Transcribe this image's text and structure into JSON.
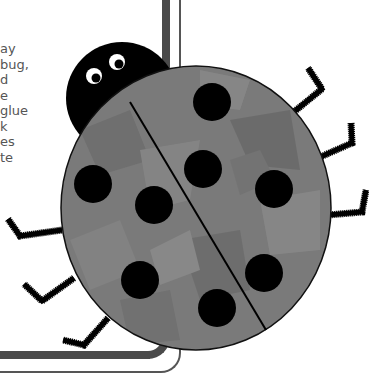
{
  "text_fragment": {
    "lines": [
      "ay",
      "bug,",
      "d",
      "e",
      "glue",
      "k",
      "es",
      "te"
    ]
  },
  "illustration": {
    "subject": "ladybug",
    "body_color": "#7a7a7a",
    "spot_color": "#000000",
    "head_color": "#000000",
    "spot_count": 8,
    "leg_count": 6
  },
  "icons": {
    "ladybug": "ladybug-illustration",
    "eye": "eye-icon"
  }
}
